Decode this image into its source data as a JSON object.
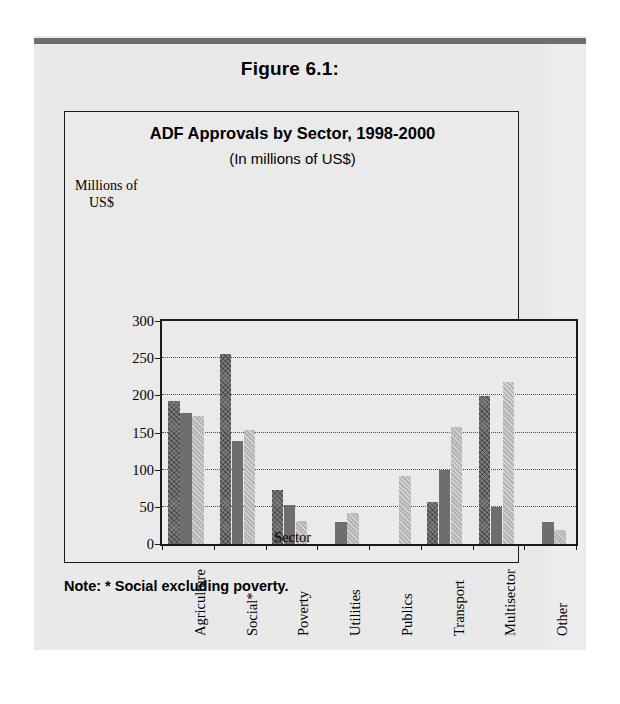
{
  "page": {
    "figure_caption": "Figure 6.1:",
    "note": "Note: * Social excluding poverty."
  },
  "legend": {
    "items": [
      {
        "label": "1998",
        "color": "#7d7d7d"
      },
      {
        "label": "1999",
        "color": "#6e6e6e"
      },
      {
        "label": "2000",
        "color": "#b4b4b4"
      }
    ]
  },
  "axis": {
    "y_axis_caption_line1": "Millions of",
    "y_axis_caption_line2": "US$",
    "x_title": "Sector",
    "ticks": [
      "300",
      "250",
      "200",
      "150",
      "100",
      "50",
      "0"
    ]
  },
  "chart_data": {
    "type": "bar",
    "title": "ADF Approvals by Sector, 1998-2000",
    "subtitle": "(In millions of US$)",
    "xlabel": "Sector",
    "ylabel": "Millions of US$",
    "ylim": [
      0,
      300
    ],
    "ytick_step": 50,
    "grid": true,
    "legend_position": "top-right-inside",
    "categories": [
      "Agriculture",
      "Social*",
      "Poverty",
      "Utilities",
      "Publics",
      "Transport",
      "Multisector",
      "Other"
    ],
    "series": [
      {
        "name": "1998",
        "color": "#7d7d7d",
        "values": [
          193,
          255,
          72,
          0,
          0,
          57,
          199,
          0
        ]
      },
      {
        "name": "1999",
        "color": "#6e6e6e",
        "values": [
          176,
          139,
          53,
          29,
          0,
          99,
          50,
          30
        ]
      },
      {
        "name": "2000",
        "color": "#b4b4b4",
        "values": [
          172,
          153,
          31,
          42,
          92,
          157,
          218,
          19
        ]
      }
    ],
    "annotations": [
      "* Social excluding poverty."
    ]
  }
}
